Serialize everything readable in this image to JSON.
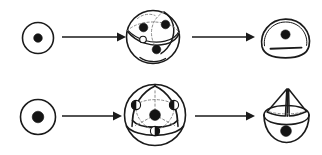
{
  "figure": {
    "background_color": "#ffffff",
    "ink_color": "#1a1a1a",
    "dash_color": "#8a8a8a",
    "marked_point_color": "#141414",
    "open_point_color": "#ffffff",
    "width": 322,
    "height": 155,
    "row_count": 2,
    "stage_count_per_row": 3,
    "arrow_count": 4
  },
  "rows": [
    {
      "id": "row-top",
      "label": "top-row",
      "stages": [
        {
          "id": "r1-s1",
          "name": "small-circle-with-center-point",
          "kind": "circle",
          "marked_points": 1,
          "open_points": 0,
          "cx": 38,
          "cy": 38,
          "r": 15.5,
          "dot_r": 4.2
        },
        {
          "id": "r1-s2",
          "name": "sphere-with-great-circles",
          "kind": "sphere",
          "marked_points": 3,
          "open_points": 1,
          "cx": 153,
          "cy": 37,
          "r": 27
        },
        {
          "id": "r1-s3",
          "name": "dome-quotient-with-slit",
          "kind": "dome",
          "marked_points": 1,
          "open_points": 0,
          "cx": 285,
          "cy": 37
        }
      ],
      "arrows": [
        {
          "id": "r1-a1",
          "name": "arrow-stage1-to-stage2",
          "x1": 62,
          "y1": 37,
          "x2": 122,
          "y2": 37
        },
        {
          "id": "r1-a2",
          "name": "arrow-stage2-to-stage3",
          "x1": 192,
          "y1": 37,
          "x2": 252,
          "y2": 37
        }
      ]
    },
    {
      "id": "row-bottom",
      "label": "bottom-row",
      "stages": [
        {
          "id": "r2-s1",
          "name": "circle-with-center-point",
          "kind": "circle",
          "marked_points": 1,
          "open_points": 0,
          "cx": 38,
          "cy": 117,
          "r": 17.5,
          "dot_r": 5.6
        },
        {
          "id": "r2-s2",
          "name": "sphere-with-inscribed-triangle",
          "kind": "sphere-triangle",
          "marked_points": 1,
          "open_points": 3,
          "cx": 155,
          "cy": 115,
          "r": 31
        },
        {
          "id": "r2-s3",
          "name": "bowl-with-cone-quotient",
          "kind": "bowl-cone",
          "marked_points": 1,
          "open_points": 0,
          "cx": 286,
          "cy": 116
        }
      ],
      "arrows": [
        {
          "id": "r2-a1",
          "name": "arrow-stage1-to-stage2",
          "x1": 62,
          "y1": 116,
          "x2": 122,
          "y2": 116
        },
        {
          "id": "r2-a2",
          "name": "arrow-stage2-to-stage3",
          "x1": 195,
          "y1": 116,
          "x2": 252,
          "y2": 116
        }
      ]
    }
  ]
}
